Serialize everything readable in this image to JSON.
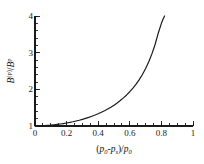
{
  "chart_data": {
    "type": "line",
    "title": "",
    "subtitle": "",
    "xlabel": "( p0-ps )/p0",
    "ylabel": "B(p)/Bp",
    "xlim": [
      0,
      1
    ],
    "ylim": [
      1,
      4
    ],
    "grid": false,
    "legend": null,
    "legend_position": "none",
    "x_major_ticks": [
      0,
      0.2,
      0.4,
      0.6,
      0.8,
      1
    ],
    "x_tick_labels": [
      "0",
      "0.2",
      "0.4",
      "0.6",
      "0.8",
      "1"
    ],
    "x_minor_tick_step": 0.05,
    "y_major_ticks": [
      1,
      2,
      3,
      4
    ],
    "y_tick_labels": [
      "1",
      "2",
      "3",
      "4"
    ],
    "y_minor_tick_step": 0.2,
    "line_color": "#1a1a1a",
    "line_width": 1.2,
    "series": [
      {
        "name": "bulk modulus ratio",
        "x": [
          0.0,
          0.02,
          0.04,
          0.06,
          0.08,
          0.1,
          0.12,
          0.14,
          0.16,
          0.18,
          0.2,
          0.22,
          0.24,
          0.26,
          0.28,
          0.3,
          0.32,
          0.34,
          0.36,
          0.38,
          0.4,
          0.42,
          0.44,
          0.46,
          0.48,
          0.5,
          0.52,
          0.54,
          0.56,
          0.58,
          0.6,
          0.62,
          0.64,
          0.66,
          0.68,
          0.7,
          0.72,
          0.74,
          0.76,
          0.78,
          0.8,
          0.81,
          0.82
        ],
        "y": [
          1.0,
          1.002,
          1.005,
          1.01,
          1.016,
          1.023,
          1.032,
          1.042,
          1.054,
          1.067,
          1.082,
          1.098,
          1.116,
          1.136,
          1.158,
          1.182,
          1.208,
          1.236,
          1.267,
          1.3,
          1.336,
          1.375,
          1.418,
          1.464,
          1.514,
          1.569,
          1.629,
          1.695,
          1.767,
          1.847,
          1.935,
          2.033,
          2.143,
          2.266,
          2.406,
          2.566,
          2.751,
          2.967,
          3.223,
          3.531,
          3.8,
          3.91,
          4.0
        ]
      }
    ]
  },
  "axis_labels": {
    "x": {
      "open_paren": "(",
      "p_main_1": "p",
      "sub_1": "0",
      "minus": "-",
      "p_main_2": "p",
      "sub_2": "s",
      "close_paren": ")",
      "slash": "/",
      "p_main_3": "p",
      "sub_3": "0"
    },
    "y": {
      "b_main_1": "B",
      "sup_1": "(p)",
      "slash": "/",
      "b_main_2": "B",
      "sup_2": "p"
    }
  }
}
